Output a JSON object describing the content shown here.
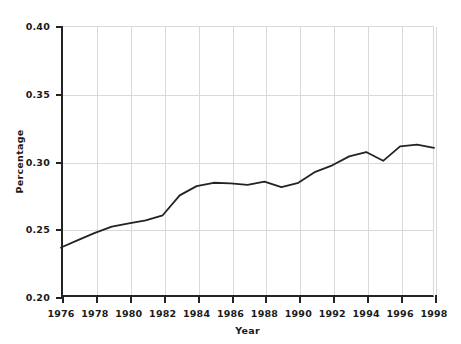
{
  "chart_data": {
    "type": "line",
    "title": "",
    "subtitle": "",
    "xlabel": "Year",
    "ylabel": "Percentage",
    "xlim": [
      1976,
      1998
    ],
    "ylim": [
      0.2,
      0.4
    ],
    "xticks": [
      1976,
      1978,
      1980,
      1982,
      1984,
      1986,
      1988,
      1990,
      1992,
      1994,
      1996,
      1998
    ],
    "xtick_labels": [
      "1976",
      "1978",
      "1980",
      "1982",
      "1984",
      "1986",
      "1988",
      "1990",
      "1992",
      "1994",
      "1996",
      "1998"
    ],
    "yticks": [
      0.2,
      0.25,
      0.3,
      0.35,
      0.4
    ],
    "ytick_labels": [
      "0.20",
      "0.25",
      "0.30",
      "0.35",
      "0.40"
    ],
    "grid": true,
    "grid_color": "#d9d9d9",
    "legend": false,
    "legend_position": "none",
    "line_color": "#232323",
    "line_width": 1.8,
    "markers": false,
    "x": [
      1976,
      1977,
      1978,
      1979,
      1980,
      1981,
      1982,
      1983,
      1984,
      1985,
      1986,
      1987,
      1988,
      1989,
      1990,
      1991,
      1992,
      1993,
      1994,
      1995,
      1996,
      1997,
      1998
    ],
    "values": [
      0.2365,
      0.242,
      0.2473,
      0.252,
      0.2543,
      0.2565,
      0.2603,
      0.275,
      0.2818,
      0.2843,
      0.2838,
      0.2828,
      0.2852,
      0.2811,
      0.2843,
      0.2924,
      0.2972,
      0.3038,
      0.307,
      0.3005,
      0.3112,
      0.3124,
      0.31
    ],
    "series": [
      {
        "name": "Percentage",
        "values": [
          0.2365,
          0.242,
          0.2473,
          0.252,
          0.2543,
          0.2565,
          0.2603,
          0.275,
          0.2818,
          0.2843,
          0.2838,
          0.2828,
          0.2852,
          0.2811,
          0.2843,
          0.2924,
          0.2972,
          0.3038,
          0.307,
          0.3005,
          0.3112,
          0.3124,
          0.31
        ]
      }
    ]
  }
}
